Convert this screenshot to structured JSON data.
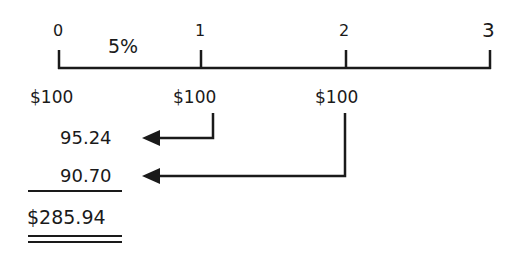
{
  "timeline": {
    "periods": [
      "0",
      "1",
      "2",
      "3"
    ],
    "rate_label": "5%",
    "cash_flows": [
      "$100",
      "$100",
      "$100"
    ]
  },
  "present_values": {
    "pv_period_1": "95.24",
    "pv_period_2": "90.70",
    "total": "$285.94"
  },
  "colors": {
    "line": "#1a1a1a",
    "background": "#ffffff"
  }
}
